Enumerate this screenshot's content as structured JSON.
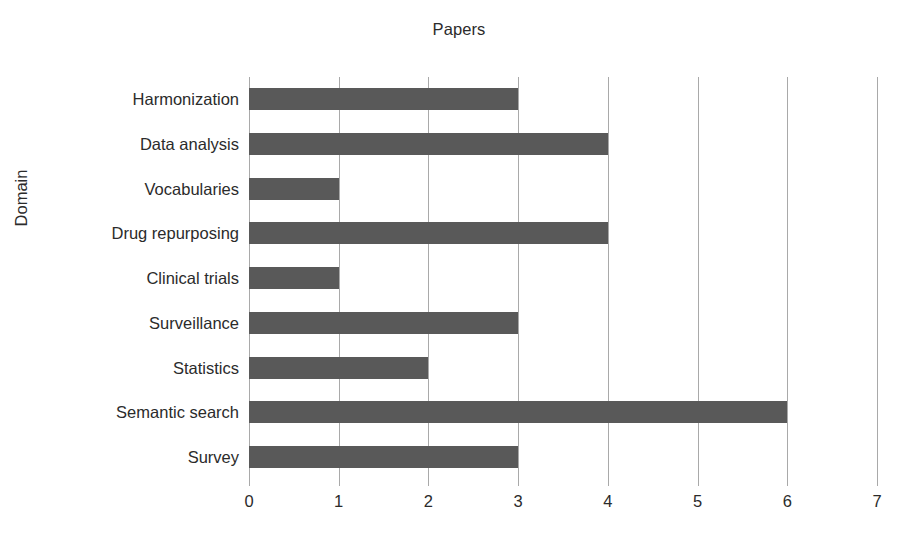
{
  "chart_data": {
    "type": "bar",
    "orientation": "horizontal",
    "title": "Papers",
    "xlabel": "",
    "ylabel": "Domain",
    "categories": [
      "Harmonization",
      "Data analysis",
      "Vocabularies",
      "Drug repurposing",
      "Clinical trials",
      "Surveillance",
      "Statistics",
      "Semantic search",
      "Survey"
    ],
    "values": [
      3,
      4,
      1,
      4,
      1,
      3,
      2,
      6,
      3
    ],
    "xlim": [
      0,
      7
    ],
    "xticks": [
      0,
      1,
      2,
      3,
      4,
      5,
      6,
      7
    ],
    "xtick_labels": [
      "0",
      "1",
      "2",
      "3",
      "4",
      "5",
      "6",
      "7"
    ],
    "grid": "vertical",
    "legend": "none",
    "colors": {
      "bar": "#595959",
      "gridline": "#a9a9a9",
      "text": "#2b2b2b",
      "background": "#ffffff"
    }
  }
}
